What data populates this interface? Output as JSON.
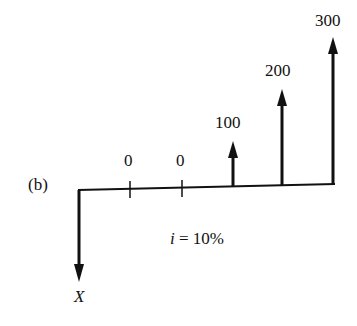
{
  "diagram": {
    "part_label": "(b)",
    "interest_label": "i = 10%",
    "interest_var": "i",
    "interest_rest": " = 10%",
    "outflow_label": "X",
    "periods": [
      {
        "index": 1,
        "value": "0"
      },
      {
        "index": 2,
        "value": "0"
      },
      {
        "index": 3,
        "value": "100"
      },
      {
        "index": 4,
        "value": "200"
      },
      {
        "index": 5,
        "value": "300"
      }
    ]
  }
}
